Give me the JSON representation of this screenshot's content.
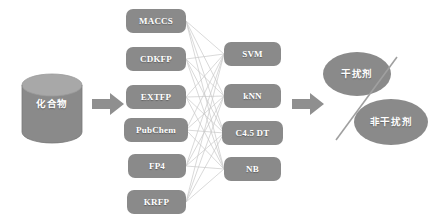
{
  "diagram": {
    "type": "flow-diagram",
    "colors": {
      "node_fill": "#8a8a8a",
      "node_fill_dark": "#7d7d7d",
      "cylinder_top": "#a8a8a8",
      "arrow_fill": "#8f8f8f",
      "mesh_line": "#c9c9c9",
      "separator_line": "#a0a0a0",
      "label_text": "#ffffff",
      "background": "#ffffff"
    },
    "input": {
      "name": "compound-database",
      "label": "化合物",
      "shape": "cylinder"
    },
    "arrows": [
      {
        "name": "arrow-input-to-fingerprints"
      },
      {
        "name": "arrow-classifiers-to-output"
      }
    ],
    "fingerprints": {
      "group_name": "molecular-fingerprints",
      "items": [
        {
          "label": "MACCS"
        },
        {
          "label": "CDKFP"
        },
        {
          "label": "EXTFP"
        },
        {
          "label": "PubChem"
        },
        {
          "label": "FP4"
        },
        {
          "label": "KRFP"
        }
      ]
    },
    "classifiers": {
      "group_name": "machine-learning-classifiers",
      "items": [
        {
          "label": "SVM"
        },
        {
          "label": "kNN"
        },
        {
          "label": "C4.5 DT"
        },
        {
          "label": "NB"
        }
      ]
    },
    "outputs": {
      "group_name": "classification-results",
      "items": [
        {
          "label": "干扰剂",
          "shape": "ellipse"
        },
        {
          "label": "非干扰剂",
          "shape": "ellipse"
        }
      ],
      "separator": {
        "name": "class-separator-line"
      }
    },
    "connections": {
      "name": "fully-connected-mesh",
      "description": "every fingerprint connects to every classifier",
      "count": 24
    }
  }
}
